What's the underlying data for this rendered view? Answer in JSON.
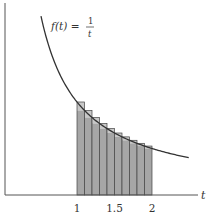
{
  "chart_data": {
    "type": "line",
    "title": "",
    "function_label": {
      "lhs": "f(t) =",
      "numerator": "1",
      "denominator": "t"
    },
    "xlabel": "t",
    "ylabel": "",
    "x_ticks": [
      {
        "value": 1,
        "label": "1"
      },
      {
        "value": 1.5,
        "label": "1.5"
      },
      {
        "value": 2,
        "label": "2"
      }
    ],
    "curve": {
      "expression": "1/t",
      "t_range": [
        0.52,
        2.49
      ]
    },
    "rectangles": {
      "count": 10,
      "interval": [
        1,
        2
      ],
      "width": 0.1,
      "height_rule": "left endpoint (upper sum)",
      "heights": [
        1.0,
        0.909,
        0.833,
        0.769,
        0.714,
        0.667,
        0.625,
        0.588,
        0.556,
        0.526
      ]
    },
    "grid": false,
    "colors": {
      "curve": "#333333",
      "rect_fill": "#a6a6a6",
      "rect_top_fill": "#c8c8c8",
      "axis": "#555555"
    }
  }
}
